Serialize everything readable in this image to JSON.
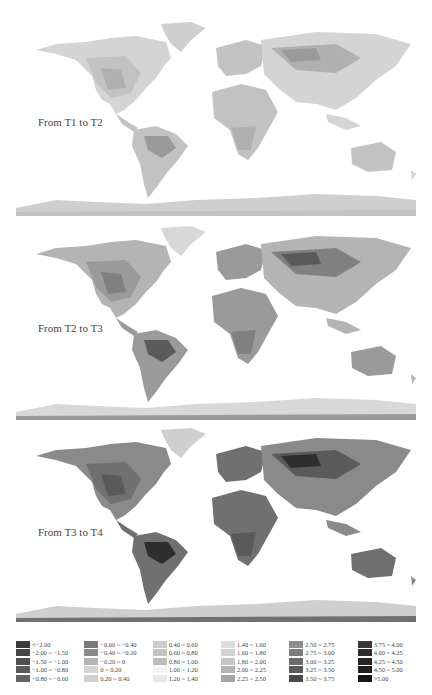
{
  "panels": [
    {
      "label": "From T1 to T2",
      "top": 18,
      "tone": "light"
    },
    {
      "label": "From T2 to T3",
      "top": 222,
      "tone": "medium"
    },
    {
      "label": "From T3 to T4",
      "top": 424,
      "tone": "dark"
    }
  ],
  "legend": {
    "columns": [
      [
        {
          "label": "<−2.00",
          "color": "#3a3a3a"
        },
        {
          "label": "−2.00 ~ −1.50",
          "color": "#454545"
        },
        {
          "label": "−1.50 ~ −1.00",
          "color": "#4f4f4f"
        },
        {
          "label": "−1.00 ~ −0.80",
          "color": "#5a5a5a"
        },
        {
          "label": "−0.80 ~ −0.60",
          "color": "#646464"
        }
      ],
      [
        {
          "label": "−0.60 ~ −0.40",
          "color": "#7a7a7a"
        },
        {
          "label": "−0.40 ~ −0.20",
          "color": "#8a8a8a"
        },
        {
          "label": "−0.20 ~ 0",
          "color": "#b5b5b5"
        },
        {
          "label": "0 ~ 0.20",
          "color": "#d5d5d5"
        },
        {
          "label": "0.20 ~ 0.40",
          "color": "#d0d0d0"
        }
      ],
      [
        {
          "label": "0.40 ~ 0.60",
          "color": "#cbcbcb"
        },
        {
          "label": "0.60 ~ 0.80",
          "color": "#c4c4c4"
        },
        {
          "label": "0.80 ~ 1.00",
          "color": "#bdbdbd"
        },
        {
          "label": "1.00 ~ 1.20",
          "color": "#f2f2f2"
        },
        {
          "label": "1.20 ~ 1.40",
          "color": "#e8e8e8"
        }
      ],
      [
        {
          "label": "1.40 ~ 1.60",
          "color": "#dcdcdc"
        },
        {
          "label": "1.60 ~ 1.80",
          "color": "#d2d2d2"
        },
        {
          "label": "1.80 ~ 2.00",
          "color": "#c6c6c6"
        },
        {
          "label": "2.00 ~ 2.25",
          "color": "#b4b4b4"
        },
        {
          "label": "2.25 ~ 2.50",
          "color": "#a6a6a6"
        }
      ],
      [
        {
          "label": "2.50 ~ 2.75",
          "color": "#8e8e8e"
        },
        {
          "label": "2.75 ~ 3.00",
          "color": "#7e7e7e"
        },
        {
          "label": "3.00 ~ 3.25",
          "color": "#6c6c6c"
        },
        {
          "label": "3.25 ~ 3.50",
          "color": "#5a5a5a"
        },
        {
          "label": "3.50 ~ 3.75",
          "color": "#484848"
        }
      ],
      [
        {
          "label": "3.75 ~ 4.00",
          "color": "#383838"
        },
        {
          "label": "4.00 ~ 4.25",
          "color": "#2e2e2e"
        },
        {
          "label": "4.25 ~ 4.50",
          "color": "#262626"
        },
        {
          "label": "4.50 ~ 5.00",
          "color": "#1e1e1e"
        },
        {
          "label": ">5.00",
          "color": "#151515"
        }
      ]
    ]
  }
}
